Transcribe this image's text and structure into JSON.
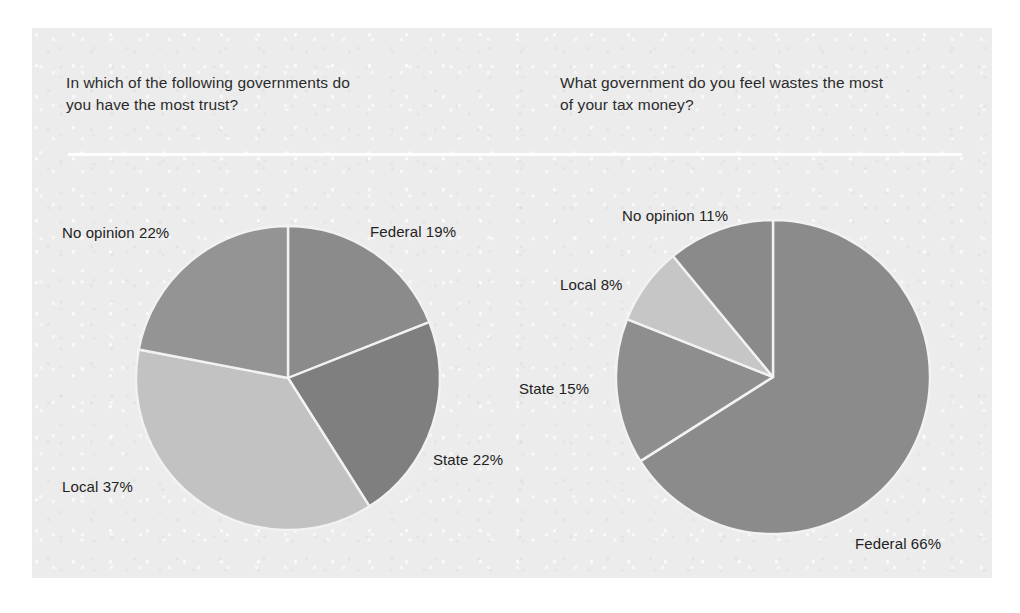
{
  "figure": {
    "background_color": "#ffffff",
    "panel_color": "#ececec",
    "divider_color": "#ffffff"
  },
  "charts": [
    {
      "name": "trust-chart",
      "question": "In which of the following governments do\nyou have the most trust?",
      "center": {
        "x": 288,
        "y": 378
      },
      "radius": 152,
      "labels": [
        {
          "name": "federal",
          "text": "Federal 19%",
          "x": 370,
          "y": 223,
          "align": "left"
        },
        {
          "name": "state",
          "text": "State 22%",
          "x": 433,
          "y": 451,
          "align": "left"
        },
        {
          "name": "local",
          "text": "Local 37%",
          "x": 62,
          "y": 478,
          "align": "left"
        },
        {
          "name": "no-opinion",
          "text": "No opinion 22%",
          "x": 62,
          "y": 224,
          "align": "left"
        }
      ]
    },
    {
      "name": "waste-chart",
      "question": "What government do you feel wastes the most\nof your tax money?",
      "center": {
        "x": 773,
        "y": 377
      },
      "radius": 157,
      "labels": [
        {
          "name": "no-opinion",
          "text": "No opinion 11%",
          "x": 622,
          "y": 207,
          "align": "left"
        },
        {
          "name": "local",
          "text": "Local 8%",
          "x": 560,
          "y": 276,
          "align": "left"
        },
        {
          "name": "state",
          "text": "State 15%",
          "x": 519,
          "y": 380,
          "align": "left"
        },
        {
          "name": "federal",
          "text": "Federal 66%",
          "x": 855,
          "y": 535,
          "align": "left"
        }
      ]
    }
  ],
  "chart_data": [
    {
      "type": "pie",
      "name": "trust-chart",
      "title": "In which of the following governments do you have the most trust?",
      "categories": [
        "Federal",
        "State",
        "Local",
        "No opinion"
      ],
      "values": [
        19,
        22,
        37,
        22
      ],
      "unit": "percent",
      "start_angle_deg": 0,
      "direction": "clockwise",
      "colors": [
        "#8b8b8b",
        "#7f7f7f",
        "#c2c2c2",
        "#949494"
      ],
      "slice_border_color": "#f2f2f2",
      "labels": [
        "Federal 19%",
        "State 22%",
        "Local 37%",
        "No opinion 22%"
      ],
      "legend": "none",
      "grid": false
    },
    {
      "type": "pie",
      "name": "waste-chart",
      "title": "What government do you feel wastes the most of your tax money?",
      "categories": [
        "Federal",
        "State",
        "Local",
        "No opinion"
      ],
      "values": [
        66,
        15,
        8,
        11
      ],
      "unit": "percent",
      "start_angle_deg": 0,
      "direction": "clockwise",
      "colors": [
        "#8b8b8b",
        "#8e8e8e",
        "#c6c6c6",
        "#8a8a8a"
      ],
      "slice_border_color": "#f2f2f2",
      "labels": [
        "Federal 66%",
        "State 15%",
        "Local 8%",
        "No opinion 11%"
      ],
      "legend": "none",
      "grid": false
    }
  ]
}
